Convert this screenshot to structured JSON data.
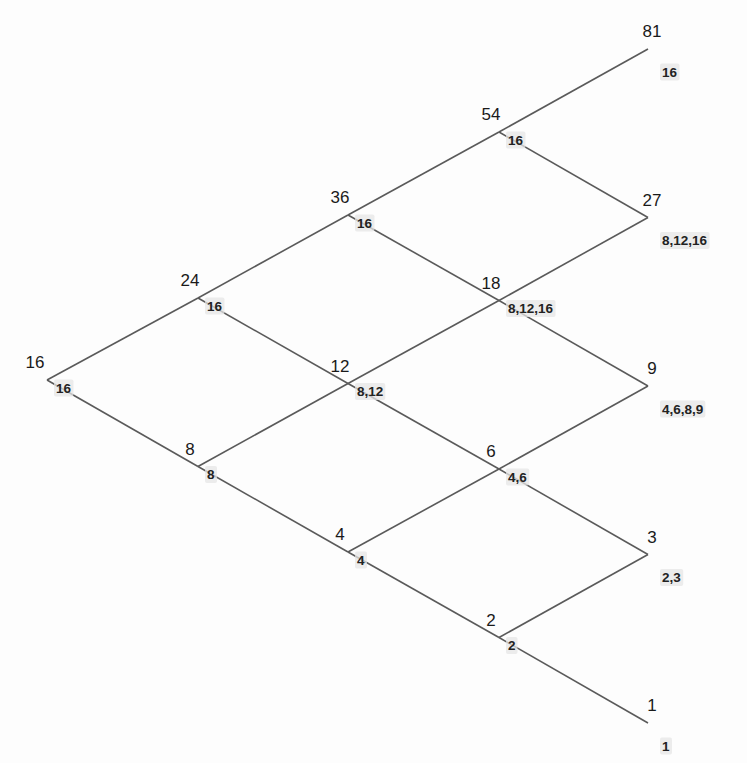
{
  "diagram": {
    "type": "binomial-tree",
    "colors": {
      "edge": "#5a5a5a",
      "label": "#1a1a1a",
      "sublabel_highlight": "#e6e6e6"
    },
    "nodes": [
      {
        "id": "n0_0",
        "step": 0,
        "down_moves": 0,
        "value": "16",
        "sublabel": "16"
      },
      {
        "id": "n1_0",
        "step": 1,
        "down_moves": 0,
        "value": "24",
        "sublabel": "16"
      },
      {
        "id": "n1_1",
        "step": 1,
        "down_moves": 1,
        "value": "8",
        "sublabel": "8"
      },
      {
        "id": "n2_0",
        "step": 2,
        "down_moves": 0,
        "value": "36",
        "sublabel": "16"
      },
      {
        "id": "n2_1",
        "step": 2,
        "down_moves": 1,
        "value": "12",
        "sublabel": "8,12"
      },
      {
        "id": "n2_2",
        "step": 2,
        "down_moves": 2,
        "value": "4",
        "sublabel": "4"
      },
      {
        "id": "n3_0",
        "step": 3,
        "down_moves": 0,
        "value": "54",
        "sublabel": "16"
      },
      {
        "id": "n3_1",
        "step": 3,
        "down_moves": 1,
        "value": "18",
        "sublabel": "8,12,16"
      },
      {
        "id": "n3_2",
        "step": 3,
        "down_moves": 2,
        "value": "6",
        "sublabel": "4,6"
      },
      {
        "id": "n3_3",
        "step": 3,
        "down_moves": 3,
        "value": "2",
        "sublabel": "2"
      },
      {
        "id": "n4_0",
        "step": 4,
        "down_moves": 0,
        "value": "81",
        "sublabel": "16"
      },
      {
        "id": "n4_1",
        "step": 4,
        "down_moves": 1,
        "value": "27",
        "sublabel": "8,12,16"
      },
      {
        "id": "n4_2",
        "step": 4,
        "down_moves": 2,
        "value": "9",
        "sublabel": "4,6,8,9"
      },
      {
        "id": "n4_3",
        "step": 4,
        "down_moves": 3,
        "value": "3",
        "sublabel": "2,3"
      },
      {
        "id": "n4_4",
        "step": 4,
        "down_moves": 4,
        "value": "1",
        "sublabel": "1"
      }
    ],
    "edges": [
      [
        "n0_0",
        "n1_0"
      ],
      [
        "n0_0",
        "n1_1"
      ],
      [
        "n1_0",
        "n2_0"
      ],
      [
        "n1_0",
        "n2_1"
      ],
      [
        "n1_1",
        "n2_1"
      ],
      [
        "n1_1",
        "n2_2"
      ],
      [
        "n2_0",
        "n3_0"
      ],
      [
        "n2_0",
        "n3_1"
      ],
      [
        "n2_1",
        "n3_1"
      ],
      [
        "n2_1",
        "n3_2"
      ],
      [
        "n2_2",
        "n3_2"
      ],
      [
        "n2_2",
        "n3_3"
      ],
      [
        "n3_0",
        "n4_0"
      ],
      [
        "n3_0",
        "n4_1"
      ],
      [
        "n3_1",
        "n4_1"
      ],
      [
        "n3_1",
        "n4_2"
      ],
      [
        "n3_2",
        "n4_2"
      ],
      [
        "n3_2",
        "n4_3"
      ],
      [
        "n3_3",
        "n4_3"
      ],
      [
        "n3_3",
        "n4_4"
      ]
    ]
  }
}
